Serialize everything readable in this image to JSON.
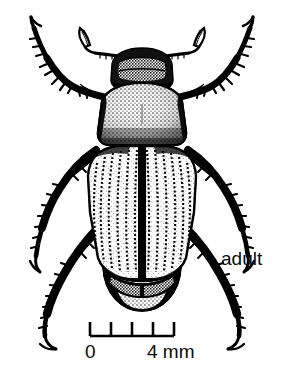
{
  "figure": {
    "kind": "scientific-line-illustration",
    "background_color": "#ffffff",
    "ink_color": "#000000"
  },
  "labels": {
    "adult": "adult"
  },
  "scale_bar": {
    "min_label": "0",
    "max_label": "4 mm",
    "unit": "mm",
    "min_value": 0,
    "max_value": 4,
    "tick_count": 5,
    "tick_values": [
      0,
      1,
      2,
      3,
      4
    ],
    "bar_color": "#000000"
  },
  "anatomy": {
    "parts": [
      "antenna-left",
      "antenna-right",
      "head",
      "pronotum",
      "scutellum",
      "elytron-left",
      "elytron-right",
      "pygidium",
      "foreleg-left",
      "foreleg-right",
      "midleg-left",
      "midleg-right",
      "hindleg-left",
      "hindleg-right"
    ]
  }
}
